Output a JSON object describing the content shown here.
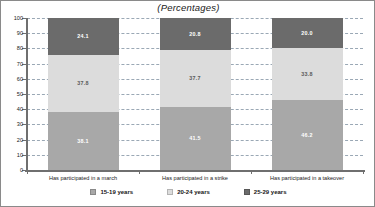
{
  "chart_data": {
    "type": "bar",
    "subtype": "stacked-bar-vertical-100pct",
    "title": "(Percentages)",
    "xlabel": "",
    "ylabel": "",
    "ylim": [
      0,
      100
    ],
    "yticks": [
      0,
      10,
      20,
      30,
      40,
      50,
      60,
      70,
      80,
      90,
      100
    ],
    "ytick_labels": [
      "0",
      "10",
      "20",
      "30",
      "40",
      "50",
      "60",
      "70",
      "80",
      "90",
      "100"
    ],
    "grid": true,
    "grid_style": "dashed-horizontal",
    "legend_position": "bottom-center",
    "categories": [
      "Has participated in a march",
      "Has participated in a strike",
      "Has participated in a takeover"
    ],
    "series": [
      {
        "name": "15-19 years",
        "color": "#a8a8a8",
        "values": [
          38.1,
          41.5,
          46.2
        ],
        "labels": [
          "38.1",
          "41.5",
          "46.2"
        ]
      },
      {
        "name": "20-24 years",
        "color": "#dcdcdc",
        "values": [
          37.8,
          37.7,
          33.8
        ],
        "labels": [
          "37.8",
          "37.7",
          "33.8"
        ]
      },
      {
        "name": "25-29 years",
        "color": "#6b6b6b",
        "values": [
          24.1,
          20.8,
          20.0
        ],
        "labels": [
          "24.1",
          "20.8",
          "20.0"
        ]
      }
    ],
    "column_totals": [
      100.0,
      100.0,
      100.0
    ]
  },
  "legend": {
    "items": [
      {
        "label": "15-19 years",
        "color": "#a8a8a8"
      },
      {
        "label": "20-24 years",
        "color": "#dcdcdc"
      },
      {
        "label": "25-29 years",
        "color": "#6b6b6b"
      }
    ]
  },
  "colors": {
    "axis": "#6f6f6f",
    "gridline": "#9aa8b5",
    "border": "#8a8a8a",
    "background": "#ffffff",
    "value_label": "#ffffff"
  }
}
